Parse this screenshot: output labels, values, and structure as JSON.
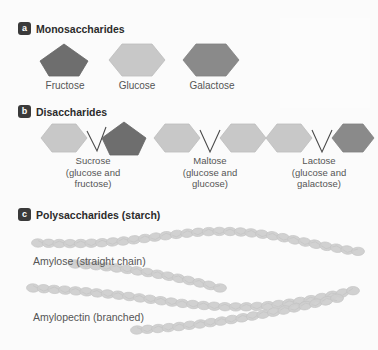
{
  "figure": {
    "background": "#fbfbfb"
  },
  "colors": {
    "badge_bg": "#3a3a3a",
    "badge_text": "#ffffff",
    "heading_text": "#2b2b2b",
    "label_text": "#555555",
    "glucose_fill": "#c8c8c8",
    "glucose_stroke": "#bcbcbc",
    "fructose_fill": "#6e6e6e",
    "fructose_stroke": "#666666",
    "galactose_fill": "#8a8a8a",
    "galactose_stroke": "#828282",
    "chain_fill": "#cfcfcf",
    "chain_stroke": "#c4c4c4",
    "bond_line": "#4a4a4a"
  },
  "sections": {
    "a": {
      "badge": "a",
      "title": "Monosaccharides",
      "items": [
        {
          "label": "Fructose",
          "shape": "pentagon",
          "fill": "fructose"
        },
        {
          "label": "Glucose",
          "shape": "hexagon",
          "fill": "glucose"
        },
        {
          "label": "Galactose",
          "shape": "hexagon",
          "fill": "galactose"
        }
      ]
    },
    "b": {
      "badge": "b",
      "title": "Disaccharides",
      "items": [
        {
          "name": "Sucrose",
          "composition_line1": "(glucose and",
          "composition_line2": "fructose)",
          "left_shape": "hexagon",
          "left_fill": "glucose",
          "right_shape": "pentagon",
          "right_fill": "fructose"
        },
        {
          "name": "Maltose",
          "composition_line1": "(glucose and",
          "composition_line2": "glucose)",
          "left_shape": "hexagon",
          "left_fill": "glucose",
          "right_shape": "hexagon",
          "right_fill": "glucose"
        },
        {
          "name": "Lactose",
          "composition_line1": "(glucose and",
          "composition_line2": "galactose)",
          "left_shape": "hexagon",
          "left_fill": "glucose",
          "right_shape": "hexagon",
          "right_fill": "galactose"
        }
      ]
    },
    "c": {
      "badge": "c",
      "title": "Polysaccharides (starch)",
      "items": [
        {
          "label": "Amylose (straight chain)",
          "structure": "straight-chain"
        },
        {
          "label": "Amylopectin (branched)",
          "structure": "branched-chain"
        }
      ]
    }
  }
}
